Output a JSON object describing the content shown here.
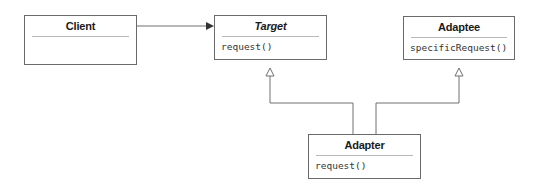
{
  "diagram": {
    "type": "UML class diagram",
    "pattern": "Adapter",
    "classes": [
      {
        "id": "client",
        "name": "Client",
        "abstract": false,
        "operations": []
      },
      {
        "id": "target",
        "name": "Target",
        "abstract": true,
        "operations": [
          "request()"
        ]
      },
      {
        "id": "adaptee",
        "name": "Adaptee",
        "abstract": false,
        "operations": [
          "specificRequest()"
        ]
      },
      {
        "id": "adapter",
        "name": "Adapter",
        "abstract": false,
        "operations": [
          "request()"
        ]
      }
    ],
    "relationships": [
      {
        "type": "association",
        "from": "Client",
        "to": "Target",
        "arrow": "filled"
      },
      {
        "type": "generalization",
        "from": "Adapter",
        "to": "Target",
        "arrow": "hollow-triangle"
      },
      {
        "type": "generalization",
        "from": "Adapter",
        "to": "Adaptee",
        "arrow": "hollow-triangle"
      }
    ]
  },
  "colors": {
    "box_border": "#6a6a6a",
    "divider": "#b8b8b8",
    "line": "#707070",
    "text": "#1a1a1a"
  }
}
